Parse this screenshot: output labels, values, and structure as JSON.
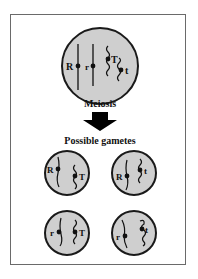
{
  "diagram": {
    "parent_cell": {
      "genes": [
        {
          "label": "R"
        },
        {
          "label": "r"
        },
        {
          "label": "T"
        },
        {
          "label": "t"
        }
      ]
    },
    "process_label": "Meiosis",
    "result_heading": "Possible gametes",
    "gametes": [
      {
        "genes": [
          "R",
          "T"
        ]
      },
      {
        "genes": [
          "R",
          "t"
        ]
      },
      {
        "genes": [
          "r",
          "T"
        ]
      },
      {
        "genes": [
          "r",
          "t"
        ]
      }
    ],
    "colors": {
      "cell_fill": "#cfcfcf",
      "cell_stroke": "#1a1a1a",
      "frame_border": "#6a6a6a",
      "arrow": "#000000"
    }
  }
}
